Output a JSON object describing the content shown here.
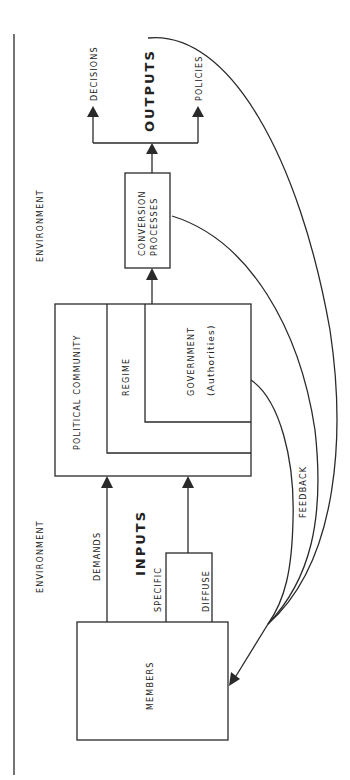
{
  "diagram": {
    "type": "systems-model",
    "orientation": "rotated-90-ccw",
    "labels": {
      "environment_top": "ENVIRONMENT",
      "environment_bottom": "ENVIRONMENT",
      "outputs": "OUTPUTS",
      "decisions": "DECISIONS",
      "policies": "POLICIES",
      "conversion_line1": "CONVERSION",
      "conversion_line2": "PROCESSES",
      "political_community": "POLITICAL COMMUNITY",
      "regime": "REGIME",
      "government_line1": "GOVERNMENT",
      "government_line2": "(Authorities)",
      "feedback": "FEEDBACK",
      "inputs": "INPUTS",
      "demands": "DEMANDS",
      "specific": "SPECIFIC",
      "diffuse": "DIFFUSE",
      "members": "MEMBERS"
    },
    "nodes": [
      "MEMBERS",
      "DIFFUSE",
      "POLITICAL COMMUNITY",
      "REGIME",
      "GOVERNMENT (Authorities)",
      "CONVERSION PROCESSES",
      "OUTPUTS"
    ],
    "edges": [
      {
        "from": "MEMBERS",
        "to": "POLITICAL COMMUNITY",
        "label": "DEMANDS"
      },
      {
        "from": "DIFFUSE",
        "to": "POLITICAL COMMUNITY",
        "label": "SPECIFIC / DIFFUSE support"
      },
      {
        "from": "POLITICAL COMMUNITY",
        "to": "CONVERSION PROCESSES"
      },
      {
        "from": "CONVERSION PROCESSES",
        "to": "OUTPUTS"
      },
      {
        "from": "OUTPUTS",
        "to": "DECISIONS"
      },
      {
        "from": "OUTPUTS",
        "to": "POLICIES"
      },
      {
        "from": "OUTPUTS",
        "to": "MEMBERS",
        "label": "FEEDBACK"
      },
      {
        "from": "CONVERSION PROCESSES",
        "to": "MEMBERS",
        "label": "FEEDBACK"
      },
      {
        "from": "GOVERNMENT (Authorities)",
        "to": "MEMBERS",
        "label": "FEEDBACK"
      }
    ]
  }
}
